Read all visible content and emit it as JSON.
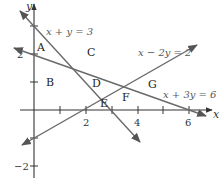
{
  "diagram": {
    "type": "linear-inequalities-regions",
    "axes": {
      "x_label": "x",
      "y_label": "y",
      "x_tick_labels": [
        "2",
        "4",
        "6"
      ],
      "y_tick_labels": [
        "2",
        "−2"
      ]
    },
    "lines": [
      {
        "equation": "x + y = 3",
        "color": "#6a6a6a"
      },
      {
        "equation": "x − 2y = 2",
        "color": "#6a6a6a"
      },
      {
        "equation": "x + 3y = 6",
        "color": "#6a6a6a"
      }
    ],
    "regions": [
      "A",
      "B",
      "C",
      "D",
      "E",
      "F",
      "G"
    ]
  }
}
